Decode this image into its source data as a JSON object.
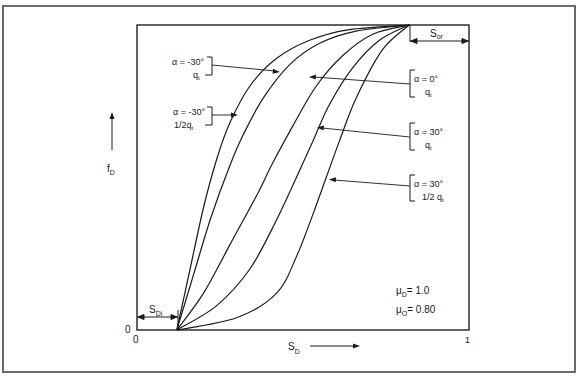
{
  "figure": {
    "y_axis_label": "f",
    "y_axis_label_sub": "D",
    "x_axis_label": "S",
    "x_axis_label_sub": "D",
    "origin_y_tick": "0",
    "origin_x_tick": "0",
    "x_end_tick": "1",
    "sdi_label": "S",
    "sdi_label_sub": "Di",
    "sor_label": "S",
    "sor_label_sub": "or",
    "params": {
      "mu_d": {
        "sym": "μ",
        "sub": "D",
        "text": "= 1.0"
      },
      "mu_o": {
        "sym": "μ",
        "sub": "O",
        "text": "= 0.80"
      }
    },
    "annotations": [
      {
        "id": "a1",
        "line1": "α = -30°",
        "line2": "q",
        "line2_sub": "t",
        "side": "left"
      },
      {
        "id": "a2",
        "line1": "α = -30°",
        "line2": "1/2q",
        "line2_sub": "t",
        "side": "left"
      },
      {
        "id": "a3",
        "line1": "α = 0°",
        "line2": "q",
        "line2_sub": "t",
        "side": "right"
      },
      {
        "id": "a4",
        "line1": "α = 30°",
        "line2": "q",
        "line2_sub": "t",
        "side": "right"
      },
      {
        "id": "a5",
        "line1": "α = 30°",
        "line2": "1/2 q",
        "line2_sub": "t",
        "side": "right"
      }
    ]
  },
  "chart_data": {
    "type": "line",
    "title": "",
    "xlabel": "S_D",
    "ylabel": "f_D",
    "xlim": [
      0,
      1
    ],
    "ylim": [
      0,
      1
    ],
    "grid": false,
    "x_ticks": [
      "0",
      "1"
    ],
    "y_ticks": [
      "0"
    ],
    "S_Di": 0.12,
    "S_or": 0.18,
    "annotations_text": [
      "μD = 1.0",
      "μO = 0.80"
    ],
    "series": [
      {
        "name": "α = -30°, 1/2 qt",
        "x": [
          0.12,
          0.16,
          0.2,
          0.24,
          0.28,
          0.34,
          0.42,
          0.52,
          0.64,
          0.82
        ],
        "y": [
          0.0,
          0.2,
          0.4,
          0.56,
          0.68,
          0.8,
          0.89,
          0.95,
          0.985,
          1.0
        ]
      },
      {
        "name": "α = -30°, qt",
        "x": [
          0.12,
          0.17,
          0.22,
          0.28,
          0.32,
          0.38,
          0.46,
          0.55,
          0.66,
          0.82
        ],
        "y": [
          0.0,
          0.18,
          0.36,
          0.54,
          0.64,
          0.76,
          0.87,
          0.94,
          0.98,
          1.0
        ]
      },
      {
        "name": "α = 0°, qt",
        "x": [
          0.12,
          0.2,
          0.28,
          0.36,
          0.41,
          0.47,
          0.54,
          0.62,
          0.71,
          0.82
        ],
        "y": [
          0.0,
          0.12,
          0.28,
          0.44,
          0.55,
          0.67,
          0.8,
          0.9,
          0.97,
          1.0
        ]
      },
      {
        "name": "α = 30°, qt",
        "x": [
          0.12,
          0.24,
          0.34,
          0.42,
          0.48,
          0.53,
          0.58,
          0.65,
          0.73,
          0.82
        ],
        "y": [
          0.0,
          0.08,
          0.2,
          0.36,
          0.5,
          0.62,
          0.74,
          0.86,
          0.95,
          1.0
        ]
      },
      {
        "name": "α = 30°, 1/2 qt",
        "x": [
          0.12,
          0.3,
          0.42,
          0.48,
          0.53,
          0.57,
          0.61,
          0.66,
          0.74,
          0.82
        ],
        "y": [
          0.0,
          0.04,
          0.12,
          0.24,
          0.38,
          0.5,
          0.62,
          0.76,
          0.92,
          1.0
        ]
      }
    ]
  }
}
